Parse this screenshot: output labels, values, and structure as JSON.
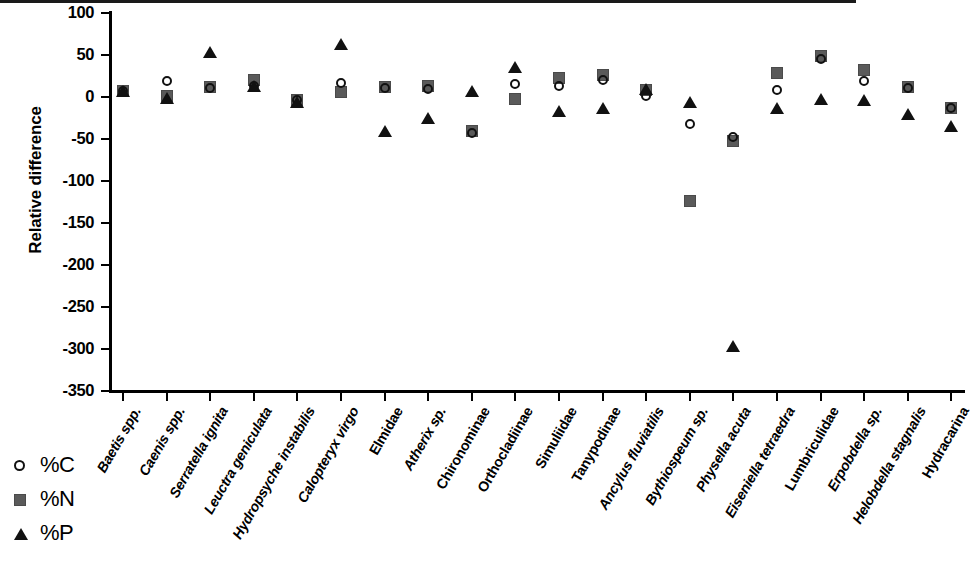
{
  "chart_data": {
    "type": "scatter",
    "title": "",
    "xlabel": "",
    "ylabel": "Relative difference",
    "ylim": [
      -350,
      100
    ],
    "yticks": [
      100,
      50,
      0,
      -50,
      -100,
      -150,
      -200,
      -250,
      -300,
      -350
    ],
    "ytick_labels": [
      "100",
      "50",
      "0",
      "-50",
      "-100",
      "-150",
      "-200",
      "-250",
      "-300",
      "-350"
    ],
    "grid": false,
    "zero_reference_line": 0,
    "legend_position": "bottom-left",
    "categories": [
      "Baetis spp.",
      "Caenis spp.",
      "Serratella ignita",
      "Leuctra geniculata",
      "Hydropsyche instabilis",
      "Calopteryx virgo",
      "Elmidae",
      "Atherix sp.",
      "Chironominae",
      "Orthocladiinae",
      "Simuliidae",
      "Tanypodinae",
      "Ancylus fluviatilis",
      "Bythiospeum sp.",
      "Physella acuta",
      "Eiseniella tetraedra",
      "Lumbriculidae",
      "Erpobdella sp.",
      "Helobdella stagnalis",
      "Hydracarina"
    ],
    "categories_italic": [
      true,
      true,
      true,
      true,
      true,
      true,
      false,
      true,
      false,
      false,
      false,
      false,
      true,
      true,
      true,
      true,
      false,
      true,
      true,
      false
    ],
    "series": [
      {
        "name": "%C",
        "marker": "open-circle",
        "color": "#111111",
        "values": [
          7,
          18,
          10,
          13,
          -4,
          16,
          10,
          9,
          -43,
          15,
          13,
          20,
          1,
          -33,
          -48,
          8,
          45,
          19,
          10,
          -14
        ]
      },
      {
        "name": "%N",
        "marker": "filled-square",
        "color": "#5a5a5a",
        "values": [
          7,
          1,
          11,
          20,
          -4,
          5,
          11,
          13,
          -41,
          -3,
          22,
          26,
          8,
          -124,
          -53,
          28,
          48,
          32,
          12,
          -14
        ]
      },
      {
        "name": "%P",
        "marker": "filled-triangle",
        "color": "#111111",
        "values": [
          7,
          -2,
          53,
          13,
          -6,
          62,
          -41,
          -25,
          7,
          35,
          -17,
          -14,
          9,
          -6,
          -297,
          -14,
          -3,
          -4,
          -21,
          -35
        ]
      }
    ]
  },
  "legend": {
    "items": [
      {
        "label": "%C",
        "marker": "open-circle"
      },
      {
        "label": "%N",
        "marker": "filled-square"
      },
      {
        "label": "%P",
        "marker": "filled-triangle"
      }
    ]
  }
}
